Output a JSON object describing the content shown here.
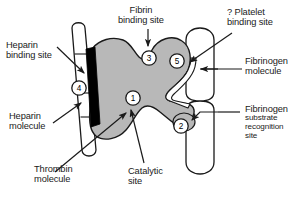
{
  "figure": {
    "background_color": "#ffffff",
    "thrombin_fill": "#b8b8b8",
    "outline_color": "#1a1a1a",
    "heparin_binding_bar_color": "#000000"
  },
  "labels": {
    "heparin_binding_site": {
      "line1": "Heparin",
      "line2": "binding site"
    },
    "fibrin_binding_site": {
      "line1": "Fibrin",
      "line2": "binding site"
    },
    "platelet_binding_site": {
      "line1": "? Platelet",
      "line2": "binding site"
    },
    "fibrinogen_molecule": {
      "line1": "Fibrinogen",
      "line2": "molecule"
    },
    "heparin_molecule": {
      "line1": "Heparin",
      "line2": "molecule"
    },
    "thrombin_molecule": {
      "line1": "Thrombin",
      "line2": "molecule"
    },
    "catalytic_site": {
      "line1": "Catalytic",
      "line2": "site"
    },
    "fibrinogen_substrate_recognition_site": {
      "line1": "Fibrinogen",
      "line2": "substrate",
      "line3": "recognition",
      "line4": "site"
    }
  },
  "callouts": [
    {
      "id": "1",
      "number": "1",
      "meaning": "Catalytic site"
    },
    {
      "id": "2",
      "number": "2",
      "meaning": "Fibrinogen substrate recognition site"
    },
    {
      "id": "3",
      "number": "3",
      "meaning": "Fibrin binding site"
    },
    {
      "id": "4",
      "number": "4",
      "meaning": "Heparin binding site"
    },
    {
      "id": "5",
      "number": "5",
      "meaning": "Platelet binding site"
    }
  ]
}
